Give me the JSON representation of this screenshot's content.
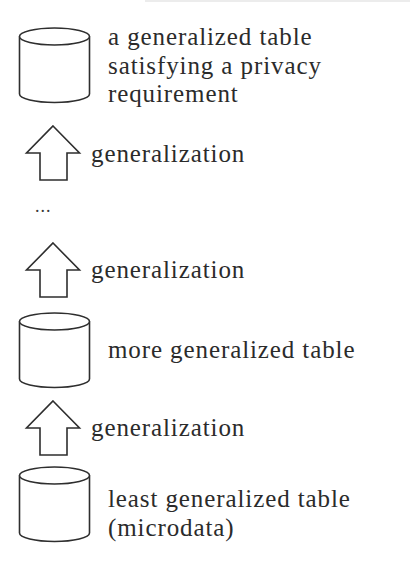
{
  "diagram": {
    "type": "generalization-hierarchy",
    "direction": "bottom-to-top",
    "colors": {
      "stroke": "#2e2e2e",
      "text": "#2b2b2b",
      "background": "#ffffff"
    },
    "nodes": [
      {
        "id": "top",
        "icon": "database-cylinder-icon",
        "lines": [
          "a generalized table",
          "satisfying a privacy",
          "requirement"
        ]
      },
      {
        "id": "middle",
        "icon": "database-cylinder-icon",
        "lines": [
          "more generalized table"
        ]
      },
      {
        "id": "bottom",
        "icon": "database-cylinder-icon",
        "lines": [
          "least generalized table",
          "(microdata)"
        ]
      }
    ],
    "edges": [
      {
        "icon": "up-arrow-icon",
        "label": "generalization"
      },
      {
        "icon": "up-arrow-icon",
        "label": "generalization"
      },
      {
        "icon": "up-arrow-icon",
        "label": "generalization"
      }
    ],
    "ellipsis": "..."
  }
}
